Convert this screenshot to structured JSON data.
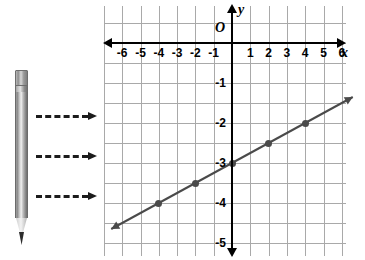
{
  "figure": {
    "kind": "coordinate-plane-with-line",
    "pencil_icon": "pencil-icon",
    "arrows": [
      {
        "name": "dashed-arrow-1"
      },
      {
        "name": "dashed-arrow-2"
      },
      {
        "name": "dashed-arrow-3"
      }
    ]
  },
  "chart_data": {
    "type": "line",
    "title": "",
    "xlabel": "x",
    "ylabel": "y",
    "origin_label": "O",
    "xlim": [
      -6.8,
      6.8
    ],
    "ylim": [
      -5.4,
      0.6
    ],
    "grid": true,
    "grid_step_x": 1,
    "grid_step_y": 0.5,
    "x_ticks": [
      -6,
      -5,
      -4,
      -3,
      -2,
      -1,
      1,
      2,
      3,
      4,
      5,
      6
    ],
    "x_tick_labels": [
      "-6",
      "-5",
      "-4",
      "-3",
      "-2",
      "-1",
      "1",
      "2",
      "3",
      "4",
      "5",
      "6"
    ],
    "y_ticks": [
      -1,
      -2,
      -3,
      -4,
      -5
    ],
    "y_tick_labels": [
      "-1",
      "-2",
      "-3",
      "-4",
      "-5"
    ],
    "series": [
      {
        "name": "line",
        "equation": "y = 0.25x - 3",
        "slope": 0.25,
        "intercept": -3,
        "color": "#4a4a4a",
        "x": [
          -6.6,
          6.6
        ],
        "y": [
          -4.65,
          -1.35
        ],
        "points": [
          {
            "x": -4,
            "y": -4
          },
          {
            "x": -2,
            "y": -3.5
          },
          {
            "x": 0,
            "y": -3
          },
          {
            "x": 2,
            "y": -2.5
          },
          {
            "x": 4,
            "y": -2
          }
        ]
      }
    ],
    "legend": [],
    "legend_position": "none",
    "annotations": []
  },
  "colors": {
    "grid": "#a9a9a9",
    "axis": "#000000",
    "line": "#4a4a4a",
    "point": "#4a4a4a",
    "background": "#ffffff"
  }
}
